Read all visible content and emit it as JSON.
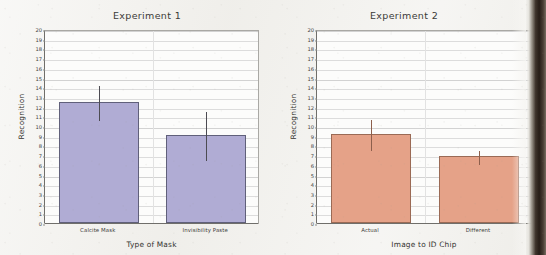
{
  "figure": {
    "background_color": "#f0efeb",
    "page_edge_color": "#261d17"
  },
  "chart_data": [
    {
      "type": "bar",
      "title": "Experiment 1",
      "xlabel": "Type of Mask",
      "ylabel": "Recognition",
      "categories": [
        "Calcite Mask",
        "Invisibility Paste"
      ],
      "values": [
        12.5,
        9.1
      ],
      "errors": [
        1.8,
        2.5
      ],
      "error_upper": [
        14.3,
        11.6
      ],
      "error_lower": [
        10.7,
        6.6
      ],
      "ylim": [
        0,
        20
      ],
      "ytick_step": 1,
      "yticks": [
        0,
        1,
        2,
        3,
        4,
        5,
        6,
        7,
        8,
        9,
        10,
        11,
        12,
        13,
        14,
        15,
        16,
        17,
        18,
        19,
        20
      ],
      "bar_color": "#b0acd4",
      "bar_edge_color": "#60607a",
      "error_color": "#4c4b52",
      "grid": true,
      "legend": "none"
    },
    {
      "type": "bar",
      "title": "Experiment 2",
      "xlabel": "Image to ID Chip",
      "ylabel": "Recognition",
      "categories": [
        "Actual",
        "Different"
      ],
      "values": [
        9.2,
        6.9
      ],
      "errors": [
        1.6,
        0.7
      ],
      "error_upper": [
        10.8,
        7.6
      ],
      "error_lower": [
        7.6,
        6.2
      ],
      "ylim": [
        0,
        20
      ],
      "ytick_step": 1,
      "yticks": [
        0,
        1,
        2,
        3,
        4,
        5,
        6,
        7,
        8,
        9,
        10,
        11,
        12,
        13,
        14,
        15,
        16,
        17,
        18,
        19,
        20
      ],
      "bar_color": "#e5a288",
      "bar_edge_color": "#9a6a55",
      "error_color": "#8d5f4c",
      "grid": true,
      "legend": "none"
    }
  ]
}
